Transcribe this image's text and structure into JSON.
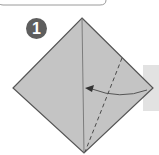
{
  "diagram": {
    "type": "origami-instruction",
    "step": {
      "number": "1"
    },
    "colors": {
      "paper": "#c4c4c4",
      "paper_edge": "#555555",
      "step_circle": "#5e5e5e",
      "side_panel": "#e2e2e2",
      "arrow": "#555555",
      "header_border": "#9a9a9a"
    },
    "elements": [
      {
        "id": "square-paper",
        "shape": "diamond",
        "points": [
          [
            82,
            18
          ],
          [
            153,
            88
          ],
          [
            84,
            153
          ],
          [
            13,
            88
          ]
        ]
      },
      {
        "id": "center-crease",
        "style": "solid",
        "from": [
          82,
          18
        ],
        "to": [
          84,
          153
        ]
      },
      {
        "id": "valley-fold-line",
        "style": "dashed",
        "from": [
          122,
          58
        ],
        "to": [
          85,
          152
        ]
      },
      {
        "id": "fold-arrow",
        "direction": "right-to-left",
        "from": [
          147,
          90
        ],
        "to": [
          86,
          88
        ]
      }
    ]
  }
}
